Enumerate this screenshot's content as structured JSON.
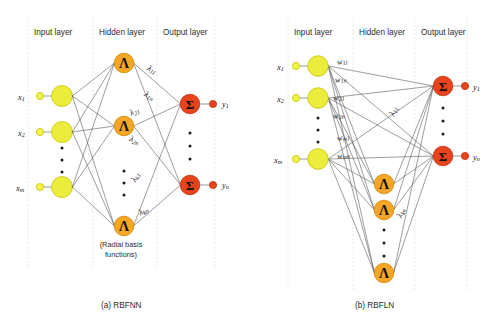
{
  "figure": {
    "background": "#ffffff",
    "panels": [
      {
        "id": "rbfnn",
        "caption": "(a) RBFNN",
        "layer_labels": [
          "Input layer",
          "Hidden layer",
          "Output layer"
        ],
        "note": "(Radial basis",
        "note2": "functions)",
        "input_labels": [
          "x",
          "x",
          "x"
        ],
        "input_subs": [
          "1",
          "2",
          "m"
        ],
        "output_labels": [
          "y",
          "y"
        ],
        "output_subs": [
          "1",
          "n"
        ],
        "hidden_glyph": "Λ",
        "output_glyph": "Σ",
        "weight_labels": [
          {
            "base": "λ",
            "sub": "11"
          },
          {
            "base": "λ",
            "sub": "1n"
          },
          {
            "base": "λ",
            "sub": "21"
          },
          {
            "base": "λ",
            "sub": "2n"
          },
          {
            "base": "λ",
            "sub": "k1"
          },
          {
            "base": "λ",
            "sub": "kn"
          }
        ]
      },
      {
        "id": "rbfln",
        "caption": "(b) RBFLN",
        "layer_labels": [
          "Input layer",
          "Hidden layer",
          "Output layer"
        ],
        "input_labels": [
          "x",
          "x",
          "x"
        ],
        "input_subs": [
          "1",
          "2",
          "m"
        ],
        "output_labels": [
          "y",
          "y"
        ],
        "output_subs": [
          "1",
          "n"
        ],
        "hidden_glyph": "Λ",
        "output_glyph": "Σ",
        "weight_labels": [
          {
            "base": "w",
            "sub": "11"
          },
          {
            "base": "w",
            "sub": "1n"
          },
          {
            "base": "w",
            "sub": "21"
          },
          {
            "base": "w",
            "sub": "2n"
          },
          {
            "base": "w",
            "sub": "m1"
          },
          {
            "base": "w",
            "sub": "mn"
          },
          {
            "base": "λ",
            "sub": "11"
          },
          {
            "base": "λ",
            "sub": "kn"
          }
        ]
      }
    ],
    "colors": {
      "input_node_fill": "#ecec3c",
      "input_node_stroke": "#c9c400",
      "input_small_fill": "#f2f24a",
      "hidden_node_fill": "#f5a623",
      "hidden_node_stroke": "#d4860a",
      "output_node_fill": "#e8431c",
      "output_node_stroke": "#c1350f",
      "output_small_fill": "#e8431c",
      "edge": "#4d4d4d",
      "divider": "#d9d9d9",
      "text": "#262626"
    }
  }
}
